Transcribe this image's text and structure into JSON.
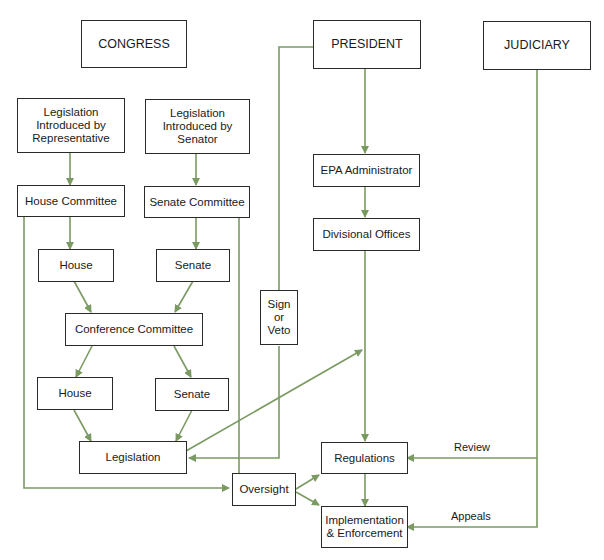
{
  "diagram": {
    "type": "flowchart",
    "line_color": "#7a9a62",
    "nodes": {
      "congress": "CONGRESS",
      "president": "PRESIDENT",
      "judiciary": "JUDICIARY",
      "leg_rep": "Legislation\nIntroduced by\nRepresentative",
      "leg_sen": "Legislation\nIntroduced by\nSenator",
      "house_committee": "House Committee",
      "senate_committee": "Senate Committee",
      "house1": "House",
      "senate1": "Senate",
      "conference": "Conference Committee",
      "house2": "House",
      "senate2": "Senate",
      "legislation": "Legislation",
      "sign_veto": "Sign\nor\nVeto",
      "epa": "EPA Administrator",
      "divisional": "Divisional Offices",
      "regulations": "Regulations",
      "oversight": "Oversight",
      "implementation": "Implementation\n& Enforcement"
    },
    "edge_labels": {
      "review": "Review",
      "appeals": "Appeals"
    }
  }
}
